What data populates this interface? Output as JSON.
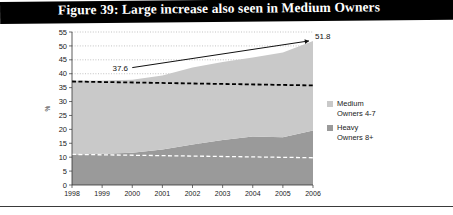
{
  "figure": {
    "title": "Figure 39: Large increase also seen in Medium Owners",
    "caption": "",
    "title_bg": "#000000",
    "title_fg": "#ffffff"
  },
  "legend": {
    "position": "right",
    "items": [
      {
        "label": "Medium\nOwners 4-7",
        "color": "#c9c9c9",
        "name": "medium-owners"
      },
      {
        "label": "Heavy\nOwners 8+",
        "color": "#9a9a9a",
        "name": "heavy-owners"
      }
    ]
  },
  "chart_data": {
    "type": "area",
    "stacked": true,
    "title": "Figure 39: Large increase also seen in Medium Owners",
    "xlabel": "",
    "ylabel": "%",
    "x": [
      "1998",
      "1999",
      "2000",
      "2001",
      "2002",
      "2003",
      "2004",
      "2005",
      "2006"
    ],
    "xticks": [
      "1998",
      "1999",
      "2000",
      "2001",
      "2002",
      "2003",
      "2004",
      "2005",
      "2006"
    ],
    "yticks": [
      0,
      5,
      10,
      15,
      20,
      25,
      30,
      35,
      40,
      45,
      50,
      55
    ],
    "ylim": [
      0,
      55
    ],
    "grid": "horizontal-dotted",
    "series": [
      {
        "name": "Heavy Owners 8+",
        "color": "#9a9a9a",
        "values": [
          11.0,
          11.2,
          11.6,
          12.8,
          14.6,
          16.2,
          17.4,
          17.2,
          19.6
        ]
      },
      {
        "name": "Medium Owners 4-7",
        "color": "#c9c9c9",
        "values": [
          26.6,
          26.4,
          26.2,
          26.6,
          27.6,
          28.0,
          28.4,
          30.4,
          32.2
        ]
      }
    ],
    "totals": [
      37.6,
      37.6,
      37.8,
      39.4,
      42.2,
      44.2,
      45.8,
      47.6,
      51.8
    ],
    "trendlines": [
      {
        "name": "medium-trend",
        "style": "dashed",
        "color": "#000000",
        "y_start": 37.2,
        "y_end": 35.8
      },
      {
        "name": "heavy-trend",
        "style": "dashed",
        "color": "#ffffff",
        "y_start": 11.0,
        "y_end": 9.8
      }
    ],
    "annotations": [
      {
        "name": "start-value-label",
        "text": "37.6",
        "x": "2000",
        "y": 41.0
      },
      {
        "name": "end-value-label",
        "text": "51.8",
        "x": "2006",
        "y": 52.4
      },
      {
        "name": "growth-arrow",
        "type": "arrow",
        "from": {
          "x": "2000",
          "y": 42.2
        },
        "to": {
          "x": "2006",
          "y": 51.8
        }
      }
    ]
  }
}
